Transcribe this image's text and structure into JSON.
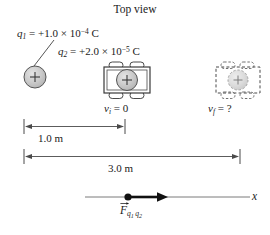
{
  "figure": {
    "title": "Top view",
    "width": 270,
    "height": 235,
    "background": "#ffffff",
    "ink_color": "#1a1a1a",
    "line_color": "#555555",
    "sphere_fill": "#c9c9c9",
    "cart_body_fill": "#ffffff",
    "ghost_fill": "#d6d6d6"
  },
  "charges": {
    "q1": {
      "symbol": "q",
      "subscript": "1",
      "equals": "=",
      "value": "+1.0",
      "times": "×",
      "base": "10",
      "exponent": "−4",
      "unit": "C",
      "full_text": "q1 = +1.0 × 10−4 C",
      "sign_glyph": "+"
    },
    "q2": {
      "symbol": "q",
      "subscript": "2",
      "equals": "=",
      "value": "+2.0",
      "times": "×",
      "base": "10",
      "exponent": "−5",
      "unit": "C",
      "full_text": "q2 = +2.0 × 10−5 C",
      "sign_glyph": "+"
    }
  },
  "objects": {
    "fixed_charge": {
      "name": "fixed point charge q1",
      "sign_glyph": "+"
    },
    "cart_initial": {
      "name": "cart carrying q2 at initial position",
      "sign_glyph": "+",
      "style": "solid",
      "velocity_label": {
        "symbol": "v",
        "subscript": "i",
        "equals": "=",
        "value": "0",
        "full_text": "vi = 0"
      }
    },
    "cart_final": {
      "name": "cart carrying q2 at final position",
      "sign_glyph": "+",
      "style": "dashed",
      "velocity_label": {
        "symbol": "v",
        "subscript": "f",
        "equals": "=",
        "value": "?",
        "full_text": "vf = ?"
      }
    }
  },
  "dimensions": [
    {
      "id": "dim-1m",
      "label": "1.0 m",
      "value": 1.0,
      "unit": "m",
      "from_px": 24,
      "to_px": 125,
      "y_px": 126
    },
    {
      "id": "dim-3m",
      "label": "3.0 m",
      "value": 3.0,
      "unit": "m",
      "from_px": 24,
      "to_px": 240,
      "y_px": 156
    }
  ],
  "axis": {
    "name": "x axis",
    "label": "x",
    "y_px": 197,
    "from_px": 85,
    "to_px": 250
  },
  "force_vector": {
    "symbol": "F",
    "has_vector_arrow": true,
    "subscript_1": "q",
    "subscript_1_index": "1",
    "subscript_2": "q",
    "subscript_2_index": "2",
    "full_text": "F q1 q2",
    "direction": "+x",
    "tail_px": 128,
    "head_px": 166
  }
}
